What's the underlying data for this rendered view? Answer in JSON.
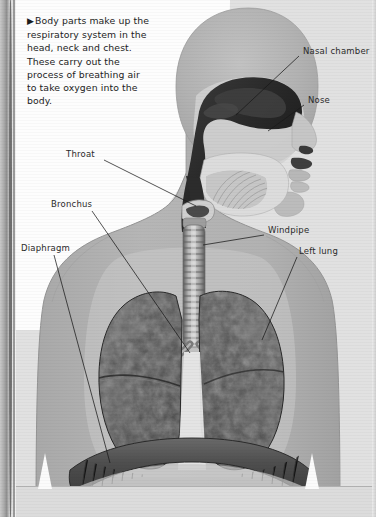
{
  "page": {
    "width": 376,
    "height": 517,
    "background_color": "#e1e1e1",
    "paper_color": "#fdfdfd"
  },
  "caption": {
    "bullet": "▶",
    "text": "Body parts make up the respiratory system in the head, neck and chest. These carry out the process of breathing air to take oxygen into the body."
  },
  "diagram": {
    "title": "Respiratory system",
    "colors": {
      "body_silhouette": "#b3b3b3",
      "body_outline": "#9a9a9a",
      "lung_dark": "#4a4a4a",
      "lung_mottle": "#6d6d6d",
      "airway_dark": "#2e2e2e",
      "trachea": "#8e8e8e",
      "diaphragm": "#555555",
      "leader_line": "#1a1a1a"
    },
    "labels": [
      {
        "id": "nasal-chamber",
        "text": "Nasal chamber",
        "side": "right",
        "text_x": 303,
        "text_y": 53,
        "line_x1": 299,
        "line_y1": 56,
        "line_x2": 236,
        "line_y2": 115
      },
      {
        "id": "nose",
        "text": "Nose",
        "side": "right",
        "text_x": 308,
        "text_y": 102,
        "line_x1": 304,
        "line_y1": 105,
        "line_x2": 268,
        "line_y2": 131
      },
      {
        "id": "throat",
        "text": "Throat",
        "side": "left",
        "text_x": 66,
        "text_y": 156,
        "line_x1": 104,
        "line_y1": 160,
        "line_x2": 196,
        "line_y2": 206
      },
      {
        "id": "bronchus",
        "text": "Bronchus",
        "side": "left",
        "text_x": 51,
        "text_y": 206,
        "line_x1": 92,
        "line_y1": 211,
        "line_x2": 190,
        "line_y2": 353
      },
      {
        "id": "windpipe",
        "text": "Windpipe",
        "side": "right",
        "text_x": 268,
        "text_y": 232,
        "line_x1": 264,
        "line_y1": 235,
        "line_x2": 203,
        "line_y2": 245
      },
      {
        "id": "left-lung",
        "text": "Left lung",
        "side": "right",
        "text_x": 299,
        "text_y": 253,
        "line_x1": 297,
        "line_y1": 257,
        "line_x2": 262,
        "line_y2": 340
      },
      {
        "id": "diaphragm",
        "text": "Diaphragm",
        "side": "left",
        "text_x": 21,
        "text_y": 250,
        "line_x1": 54,
        "line_y1": 255,
        "line_x2": 110,
        "line_y2": 463
      }
    ],
    "parts": [
      "head",
      "nasal chamber",
      "nose",
      "mouth",
      "tongue",
      "throat",
      "larynx",
      "windpipe",
      "bronchus",
      "left lung",
      "right lung",
      "diaphragm"
    ]
  }
}
